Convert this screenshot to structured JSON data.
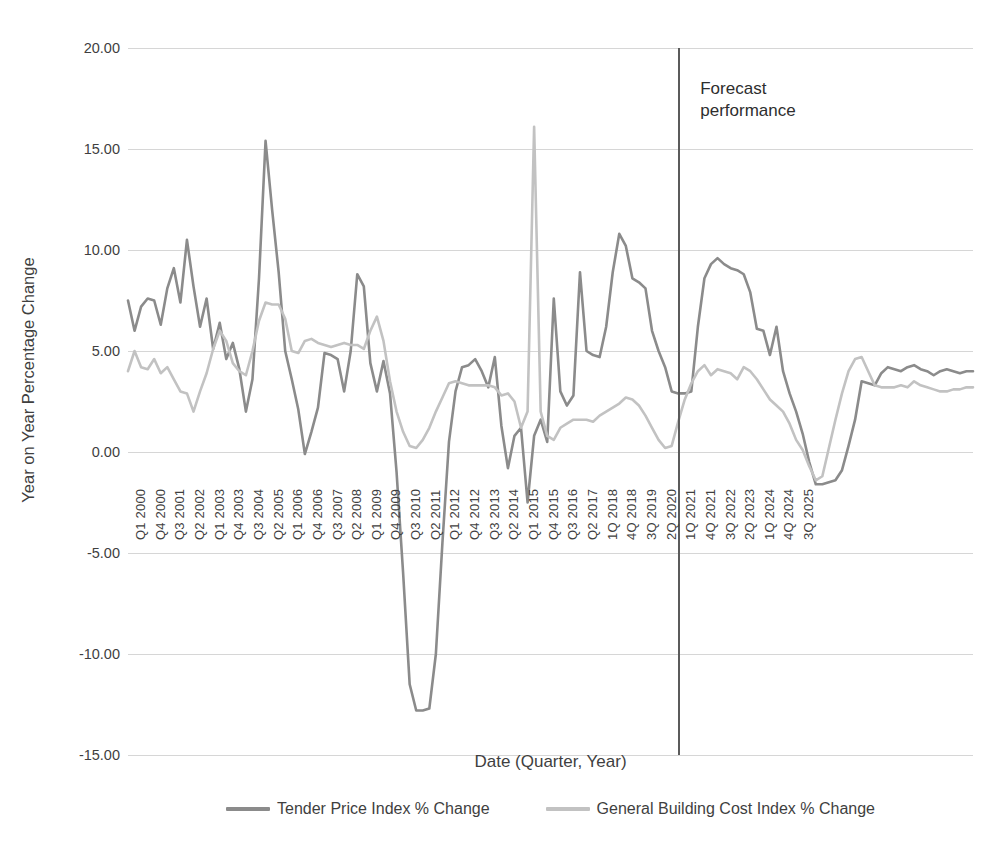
{
  "chart_data": {
    "type": "line",
    "title": "",
    "xlabel": "Date  (Quarter, Year)",
    "ylabel": "Year on Year Percentage Change",
    "ylim": [
      -15,
      20
    ],
    "ytick_labels": [
      "20.00",
      "15.00",
      "10.00",
      "5.00",
      "0.00",
      "-5.00",
      "-10.00",
      "-15.00"
    ],
    "ytick_values": [
      20,
      15,
      10,
      5,
      0,
      -5,
      -10,
      -15
    ],
    "grid": true,
    "legend_position": "bottom",
    "xtick_labels": [
      "Q1 2000",
      "Q4 2000",
      "Q3 2001",
      "Q2 2002",
      "Q1 2003",
      "Q4 2003",
      "Q3 2004",
      "Q2 2005",
      "Q1 2006",
      "Q4 2006",
      "Q3 2007",
      "Q2 2008",
      "Q1 2009",
      "Q4 2009",
      "Q3 2010",
      "Q2 2011",
      "Q1 2012",
      "Q4 2012",
      "Q3 2013",
      "Q2 2014",
      "Q1 2015",
      "Q4 2015",
      "Q3 2016",
      "Q2 2017",
      "1Q 2018",
      "4Q 2018",
      "3Q 2019",
      "2Q 2020",
      "1Q 2021",
      "4Q 2021",
      "3Q 2022",
      "2Q 2023",
      "1Q 2024",
      "4Q 2024",
      "3Q 2025"
    ],
    "xtick_every": 3,
    "x_start_label": "Q1 2000",
    "n_points": 104,
    "annotations": [
      {
        "text_line1": "Forecast",
        "text_line2": "performance",
        "at_label": "1Q 2021"
      }
    ],
    "divider": {
      "label": "1Q 2021",
      "index": 84,
      "color": "#5b5b5b"
    },
    "series": [
      {
        "name": "Tender Price Index % Change",
        "color": "#8b8b8b",
        "values": [
          7.5,
          6.0,
          7.2,
          7.6,
          7.5,
          6.3,
          8.1,
          9.1,
          7.4,
          10.5,
          8.2,
          6.2,
          7.6,
          5.1,
          6.4,
          4.6,
          5.4,
          4.1,
          2.0,
          3.6,
          8.6,
          15.4,
          12.0,
          8.9,
          5.0,
          3.6,
          2.1,
          -0.1,
          1.0,
          2.2,
          4.9,
          4.8,
          4.6,
          3.0,
          5.0,
          8.8,
          8.2,
          4.4,
          3.0,
          4.5,
          2.9,
          -1.0,
          -6.0,
          -11.5,
          -12.8,
          -12.8,
          -12.7,
          -10.0,
          -4.5,
          0.5,
          3.0,
          4.2,
          4.3,
          4.6,
          4.0,
          3.2,
          4.7,
          1.3,
          -0.8,
          0.8,
          1.2,
          -2.5,
          0.8,
          1.6,
          0.5,
          7.6,
          3.0,
          2.3,
          2.8,
          8.9,
          5.0,
          4.8,
          4.7,
          6.2,
          8.9,
          10.8,
          10.2,
          8.6,
          8.4,
          8.1,
          6.0,
          5.0,
          4.2,
          3.0,
          2.9,
          2.9,
          3.0,
          6.2,
          8.6,
          9.3,
          9.6,
          9.3,
          9.1,
          9.0,
          8.8,
          7.9,
          6.1,
          6.0,
          4.8,
          6.2,
          4.0,
          2.9,
          2.0,
          0.9,
          -0.5,
          -1.6,
          -1.6,
          -1.5,
          -1.4,
          -0.9,
          0.3,
          1.6,
          3.5,
          3.4,
          3.3,
          3.9,
          4.2,
          4.1,
          4.0,
          4.2,
          4.3,
          4.1,
          4.0,
          3.8,
          4.0,
          4.1,
          4.0,
          3.9,
          4.0,
          4.0
        ]
      },
      {
        "name": "General Building Cost Index % Change",
        "color": "#c2c2c2",
        "values": [
          4.0,
          5.0,
          4.2,
          4.1,
          4.6,
          3.9,
          4.2,
          3.6,
          3.0,
          2.9,
          2.0,
          3.0,
          3.9,
          5.1,
          6.0,
          5.5,
          4.4,
          4.0,
          3.8,
          5.0,
          6.5,
          7.4,
          7.3,
          7.3,
          6.6,
          5.0,
          4.9,
          5.5,
          5.6,
          5.4,
          5.3,
          5.2,
          5.3,
          5.4,
          5.3,
          5.3,
          5.1,
          6.0,
          6.7,
          5.5,
          3.5,
          2.0,
          1.0,
          0.3,
          0.2,
          0.6,
          1.2,
          2.0,
          2.7,
          3.4,
          3.5,
          3.4,
          3.3,
          3.3,
          3.3,
          3.3,
          3.2,
          2.8,
          2.9,
          2.5,
          1.2,
          2.0,
          16.1,
          2.0,
          0.8,
          0.6,
          1.2,
          1.4,
          1.6,
          1.6,
          1.6,
          1.5,
          1.8,
          2.0,
          2.2,
          2.4,
          2.7,
          2.6,
          2.3,
          1.8,
          1.2,
          0.6,
          0.2,
          0.3,
          1.5,
          2.6,
          3.4,
          4.0,
          4.3,
          3.8,
          4.1,
          4.0,
          3.9,
          3.6,
          4.2,
          4.0,
          3.6,
          3.1,
          2.6,
          2.3,
          2.0,
          1.4,
          0.6,
          0.1,
          -0.7,
          -1.4,
          -1.2,
          0.2,
          1.6,
          2.9,
          4.0,
          4.6,
          4.7,
          4.0,
          3.3,
          3.2,
          3.2,
          3.2,
          3.3,
          3.2,
          3.5,
          3.3,
          3.2,
          3.1,
          3.0,
          3.0,
          3.1,
          3.1,
          3.2,
          3.2
        ]
      }
    ]
  },
  "legend": {
    "items": [
      {
        "label": "Tender Price Index % Change",
        "color": "#8b8b8b"
      },
      {
        "label": "General Building Cost Index % Change",
        "color": "#c2c2c2"
      }
    ]
  },
  "axes": {
    "y_title": "Year on Year Percentage Change",
    "x_title": "Date  (Quarter, Year)"
  },
  "annotation": {
    "line1": "Forecast",
    "line2": "performance"
  },
  "colors": {
    "gridline": "#d6d6d6",
    "divider": "#5b5b5b",
    "text": "#3f3f3f",
    "background": "#ffffff"
  }
}
